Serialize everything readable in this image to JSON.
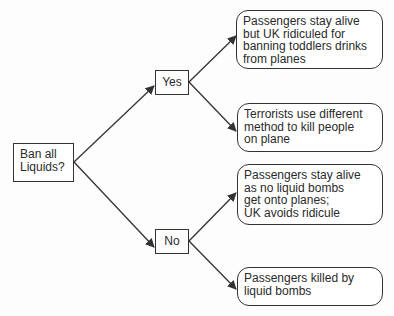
{
  "diagram": {
    "type": "decision-tree",
    "root": {
      "id": "ban",
      "lines": [
        "Ban all",
        "Liquids?"
      ]
    },
    "branches": [
      {
        "id": "yes",
        "label": "Yes",
        "outcomes": [
          {
            "id": "yes-1",
            "lines": [
              "Passengers stay alive",
              "but UK ridiculed for",
              "banning toddlers drinks",
              "from planes"
            ]
          },
          {
            "id": "yes-2",
            "lines": [
              "Terrorists use different",
              "method to kill people",
              "on plane"
            ]
          }
        ]
      },
      {
        "id": "no",
        "label": "No",
        "outcomes": [
          {
            "id": "no-1",
            "lines": [
              "Passengers stay alive",
              "as no liquid bombs",
              "get onto planes;",
              "UK avoids ridicule"
            ]
          },
          {
            "id": "no-2",
            "lines": [
              "Passengers killed by",
              "liquid bombs"
            ]
          }
        ]
      }
    ],
    "colors": {
      "stroke": "#333333",
      "text": "#2a2a2a",
      "background": "#ffffff"
    }
  }
}
